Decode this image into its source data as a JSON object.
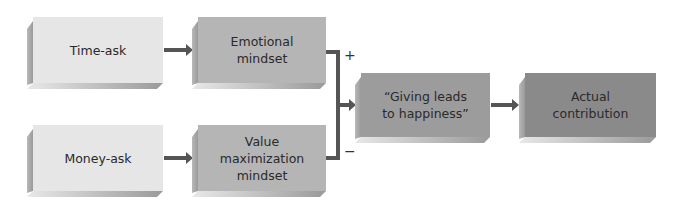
{
  "diagram": {
    "nodes": {
      "time_ask": {
        "label": "Time-ask"
      },
      "money_ask": {
        "label": "Money-ask"
      },
      "emotional": {
        "line1": "Emotional",
        "line2": "mindset"
      },
      "value_max": {
        "line1": "Value",
        "line2": "maximization",
        "line3": "mindset"
      },
      "giving": {
        "line1": "“Giving leads",
        "line2": "to happiness”"
      },
      "actual": {
        "line1": "Actual",
        "line2": "contribution"
      }
    },
    "edges": [
      {
        "from": "Time-ask",
        "to": "Emotional mindset"
      },
      {
        "from": "Money-ask",
        "to": "Value maximization mindset"
      },
      {
        "from": "Emotional mindset",
        "to": "“Giving leads to happiness”",
        "sign": "+"
      },
      {
        "from": "Value maximization mindset",
        "to": "“Giving leads to happiness”",
        "sign": "−"
      },
      {
        "from": "“Giving leads to happiness”",
        "to": "Actual contribution"
      }
    ],
    "signs": {
      "plus": "+",
      "minus": "−"
    },
    "colors": {
      "light": "#e6e6e6",
      "mid": "#b5b5b5",
      "dark": "#9c9c9c",
      "darker": "#8a8a8a",
      "arrow": "#555555"
    }
  }
}
